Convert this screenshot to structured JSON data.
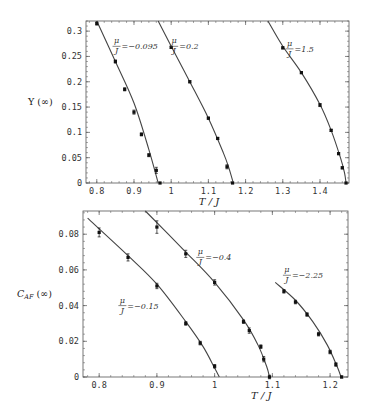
{
  "chart_data": [
    {
      "type": "line",
      "title": "",
      "xlabel": "T/J",
      "ylabel": "Υ(∞)",
      "xlim": [
        0.771,
        1.478
      ],
      "ylim": [
        0,
        0.32
      ],
      "xticks": [
        0.8,
        0.9,
        1,
        1.1,
        1.2,
        1.3,
        1.4
      ],
      "xtick_labels": [
        "0.8",
        "0.9",
        "1",
        "1.1",
        "1.2",
        "1.3",
        "1.4"
      ],
      "yticks": [
        0,
        0.05,
        0.1,
        0.15,
        0.2,
        0.25,
        0.3
      ],
      "ytick_labels": [
        "0",
        "0.05",
        "0.1",
        "0.15",
        "0.2",
        "0.25",
        "0.3"
      ],
      "grid": false,
      "series": [
        {
          "name": "μ/J=−0.095",
          "label_pos": [
            0.845,
            0.27
          ],
          "points": [
            [
              0.8,
              0.315
            ],
            [
              0.85,
              0.24
            ],
            [
              0.875,
              0.185
            ],
            [
              0.9,
              0.14
            ],
            [
              0.92,
              0.096
            ],
            [
              0.94,
              0.055
            ],
            [
              0.96,
              0.025
            ],
            [
              0.97,
              0.0
            ]
          ],
          "errors": [
            0.003,
            0.003,
            0.003,
            0.004,
            0.003,
            0.003,
            0.006,
            0.001
          ],
          "curve": [
            [
              0.8,
              0.32
            ],
            [
              0.85,
              0.24
            ],
            [
              0.9,
              0.158
            ],
            [
              0.94,
              0.066
            ],
            [
              0.965,
              0.0
            ]
          ]
        },
        {
          "name": "μ/J=0.2",
          "label_pos": [
            1.0,
            0.27
          ],
          "points": [
            [
              1.0,
              0.268
            ],
            [
              1.05,
              0.2
            ],
            [
              1.1,
              0.128
            ],
            [
              1.125,
              0.088
            ],
            [
              1.15,
              0.032
            ],
            [
              1.165,
              0.0
            ]
          ],
          "errors": [
            0.002,
            0.002,
            0.002,
            0.002,
            0.004,
            0.001
          ],
          "curve": [
            [
              0.965,
              0.32
            ],
            [
              1.0,
              0.27
            ],
            [
              1.05,
              0.2
            ],
            [
              1.1,
              0.128
            ],
            [
              1.14,
              0.06
            ],
            [
              1.155,
              0.03
            ],
            [
              1.167,
              0.0
            ]
          ]
        },
        {
          "name": "μ/J=1.5",
          "label_pos": [
            1.31,
            0.265
          ],
          "points": [
            [
              1.3,
              0.267
            ],
            [
              1.35,
              0.218
            ],
            [
              1.4,
              0.154
            ],
            [
              1.43,
              0.104
            ],
            [
              1.45,
              0.058
            ],
            [
              1.46,
              0.03
            ],
            [
              1.47,
              0.0
            ]
          ],
          "errors": [
            0.002,
            0.002,
            0.003,
            0.002,
            0.002,
            0.002,
            0.001
          ],
          "curve": [
            [
              1.26,
              0.32
            ],
            [
              1.3,
              0.27
            ],
            [
              1.35,
              0.218
            ],
            [
              1.4,
              0.155
            ],
            [
              1.43,
              0.104
            ],
            [
              1.455,
              0.05
            ],
            [
              1.466,
              0.02
            ],
            [
              1.47,
              0.0
            ]
          ]
        }
      ]
    },
    {
      "type": "line",
      "title": "",
      "xlabel": "T/J",
      "ylabel": "C_AF(∞)",
      "xlim": [
        0.772,
        1.231
      ],
      "ylim": [
        0,
        0.093
      ],
      "xticks": [
        0.8,
        0.9,
        1,
        1.1,
        1.2
      ],
      "xtick_labels": [
        "0.8",
        "0.9",
        "1",
        "1.1",
        "1.2"
      ],
      "yticks": [
        0,
        0.02,
        0.04,
        0.06,
        0.08
      ],
      "ytick_labels": [
        "0",
        "0.02",
        "0.04",
        "0.06",
        "0.08"
      ],
      "grid": false,
      "series": [
        {
          "name": "μ/J=−0.15",
          "label_pos": [
            0.835,
            0.04
          ],
          "points": [
            [
              0.8,
              0.081
            ],
            [
              0.85,
              0.067
            ],
            [
              0.9,
              0.051
            ],
            [
              0.95,
              0.03
            ],
            [
              0.975,
              0.019
            ],
            [
              1.0,
              0.006
            ]
          ],
          "errors": [
            0.0025,
            0.002,
            0.0015,
            0.001,
            0.001,
            0.001
          ],
          "curve": [
            [
              0.78,
              0.089
            ],
            [
              0.85,
              0.068
            ],
            [
              0.9,
              0.052
            ],
            [
              0.95,
              0.031
            ],
            [
              0.98,
              0.017
            ],
            [
              1.0,
              0.005
            ],
            [
              1.008,
              0.0
            ]
          ]
        },
        {
          "name": "μ/J=−0.4",
          "label_pos": [
            0.97,
            0.067
          ],
          "points": [
            [
              0.9,
              0.084
            ],
            [
              0.95,
              0.069
            ],
            [
              1.0,
              0.053
            ],
            [
              1.05,
              0.031
            ],
            [
              1.06,
              0.026
            ],
            [
              1.08,
              0.017
            ],
            [
              1.085,
              0.01
            ],
            [
              1.095,
              0.0
            ]
          ],
          "errors": [
            0.0035,
            0.002,
            0.0015,
            0.001,
            0.0015,
            0.001,
            0.0015,
            0.001
          ],
          "curve": [
            [
              0.88,
              0.093
            ],
            [
              0.95,
              0.07
            ],
            [
              1.0,
              0.053
            ],
            [
              1.05,
              0.032
            ],
            [
              1.075,
              0.018
            ],
            [
              1.09,
              0.006
            ],
            [
              1.095,
              0.0
            ]
          ]
        },
        {
          "name": "μ/J=−2.25",
          "label_pos": [
            1.12,
            0.057
          ],
          "points": [
            [
              1.12,
              0.048
            ],
            [
              1.14,
              0.042
            ],
            [
              1.16,
              0.035
            ],
            [
              1.18,
              0.024
            ],
            [
              1.2,
              0.014
            ],
            [
              1.21,
              0.007
            ],
            [
              1.22,
              0.0
            ]
          ],
          "errors": [
            0.001,
            0.001,
            0.001,
            0.001,
            0.001,
            0.001,
            0.0005
          ],
          "curve": [
            [
              1.105,
              0.053
            ],
            [
              1.14,
              0.043
            ],
            [
              1.17,
              0.031
            ],
            [
              1.195,
              0.018
            ],
            [
              1.212,
              0.006
            ],
            [
              1.219,
              0.0
            ]
          ]
        }
      ]
    }
  ],
  "figure": {
    "panels": [
      {
        "frame": {
          "x0": 86,
          "y0": 21,
          "x1": 349,
          "y1": 183
        },
        "ylabel_text": "Υ (∞)",
        "xlabel_text": "T / J",
        "annotations": [
          {
            "num": "μ",
            "den": "J",
            "rest": "=−0.095"
          },
          {
            "num": "μ",
            "den": "J",
            "rest": "=0.2"
          },
          {
            "num": "μ",
            "den": "J",
            "rest": "=1.5"
          }
        ]
      },
      {
        "frame": {
          "x0": 83,
          "y0": 211,
          "x1": 348,
          "y1": 377
        },
        "ylabel_text": "C_AF (∞)",
        "xlabel_text": "T / J",
        "annotations": [
          {
            "num": "μ",
            "den": "J",
            "rest": "=−0.15"
          },
          {
            "num": "μ",
            "den": "J",
            "rest": "=−0.4"
          },
          {
            "num": "μ",
            "den": "J",
            "rest": "=−2.25"
          }
        ]
      }
    ],
    "colors": {
      "line": "#444444",
      "marker": "#111111",
      "frame": "#555555",
      "text": "#333333"
    }
  }
}
